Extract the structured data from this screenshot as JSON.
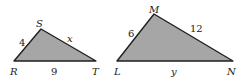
{
  "diagram": {
    "colors": {
      "fill": "#a6a6a6",
      "stroke": "#1f1f1f"
    },
    "triangle1": {
      "vertices": {
        "R": "R",
        "S": "S",
        "T": "T"
      },
      "sides": {
        "RS": "4",
        "ST": "x",
        "RT": "9"
      }
    },
    "triangle2": {
      "vertices": {
        "L": "L",
        "M": "M",
        "N": "N"
      },
      "sides": {
        "LM": "6",
        "MN": "12",
        "LN": "y"
      }
    }
  }
}
